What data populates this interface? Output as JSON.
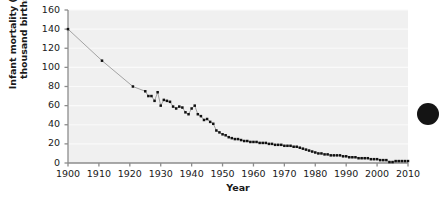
{
  "figure": {
    "name": "infant-mortality-time-series",
    "background_color": "#ffffff",
    "plot_background_color": "#f0f0f0",
    "gridline_color": "#fafafa",
    "axis_color": "#8c8c8c",
    "marker_color": "#111111",
    "line_color": "#9a9a9a"
  },
  "decoration": {
    "corner_blob_name": "page-edge-dot"
  },
  "chart_data": {
    "type": "line",
    "title": "",
    "subtitle": "",
    "xlabel": "Year",
    "ylabel": "Infant mortality (per thousand births)",
    "ylabel_line1": "Infant mortality (per",
    "ylabel_line2": "thousand births)",
    "xlim": [
      1900,
      2010
    ],
    "ylim": [
      0,
      160
    ],
    "xticks": [
      1900,
      1910,
      1920,
      1930,
      1940,
      1950,
      1960,
      1970,
      1980,
      1990,
      2000,
      2010
    ],
    "xtick_labels": [
      "1900",
      "1910",
      "1920",
      "1930",
      "1940",
      "1950",
      "1960",
      "1970",
      "1980",
      "1990",
      "2000",
      "2010"
    ],
    "yticks": [
      0,
      20,
      40,
      60,
      80,
      100,
      120,
      140,
      160
    ],
    "ytick_labels": [
      "0",
      "20",
      "40",
      "60",
      "80",
      "100",
      "120",
      "140",
      "160"
    ],
    "grid": true,
    "grid_axis": "y",
    "legend": null,
    "legend_position": "none",
    "markers": "square",
    "series": [
      {
        "name": "Infant mortality rate",
        "x": [
          1900,
          1911,
          1921,
          1925,
          1926,
          1927,
          1928,
          1929,
          1930,
          1931,
          1932,
          1933,
          1934,
          1935,
          1936,
          1937,
          1938,
          1939,
          1940,
          1941,
          1942,
          1943,
          1944,
          1945,
          1946,
          1947,
          1948,
          1949,
          1950,
          1951,
          1952,
          1953,
          1954,
          1955,
          1956,
          1957,
          1958,
          1959,
          1960,
          1961,
          1962,
          1963,
          1964,
          1965,
          1966,
          1967,
          1968,
          1969,
          1970,
          1971,
          1972,
          1973,
          1974,
          1975,
          1976,
          1977,
          1978,
          1979,
          1980,
          1981,
          1982,
          1983,
          1984,
          1985,
          1986,
          1987,
          1988,
          1989,
          1990,
          1991,
          1992,
          1993,
          1994,
          1995,
          1996,
          1997,
          1998,
          1999,
          2000,
          2001,
          2002,
          2003,
          2004,
          2005,
          2006,
          2007,
          2008,
          2009,
          2010
        ],
        "y": [
          140,
          107,
          80,
          75,
          70,
          70,
          65,
          74,
          60,
          66,
          65,
          64,
          59,
          57,
          59,
          58,
          53,
          51,
          57,
          60,
          51,
          49,
          45,
          46,
          43,
          41,
          34,
          32,
          30,
          29,
          27,
          26,
          25,
          25,
          24,
          23,
          23,
          22,
          22,
          22,
          21,
          21,
          21,
          20,
          20,
          19,
          19,
          19,
          18,
          18,
          18,
          17,
          17,
          16,
          15,
          14,
          13,
          12,
          11,
          10,
          10,
          9,
          9,
          8,
          8,
          8,
          8,
          7,
          7,
          6,
          6,
          6,
          5,
          5,
          5,
          5,
          4,
          4,
          4,
          3,
          3,
          3,
          1,
          1,
          2,
          2,
          2,
          2,
          2
        ]
      }
    ]
  }
}
